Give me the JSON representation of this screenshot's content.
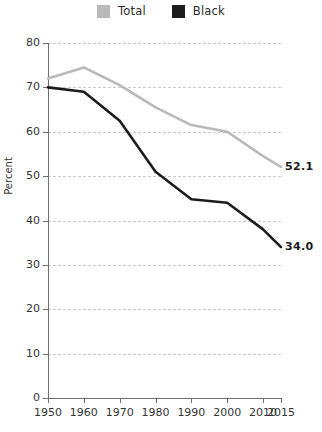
{
  "chart_data": {
    "type": "line",
    "title": "",
    "xlabel": "",
    "ylabel": "Percent",
    "grid": true,
    "legend_position": "top-center",
    "x": [
      1950,
      1960,
      1970,
      1980,
      1990,
      2000,
      2010,
      2015
    ],
    "xlim": [
      1950,
      2015
    ],
    "ylim": [
      0,
      80
    ],
    "xtick_labels": [
      "1950",
      "1960",
      "1970",
      "1980",
      "1990",
      "2000",
      "2010",
      "2015"
    ],
    "ytick_labels": [
      "0",
      "10",
      "20",
      "30",
      "40",
      "50",
      "60",
      "70",
      "80"
    ],
    "ytick_values": [
      0,
      10,
      20,
      30,
      40,
      50,
      60,
      70,
      80
    ],
    "series": [
      {
        "name": "Total",
        "color": "#b9b9b9",
        "values": [
          72.0,
          74.5,
          70.5,
          65.5,
          61.5,
          60.0,
          54.5,
          52.1
        ],
        "end_label": "52.1"
      },
      {
        "name": "Black",
        "color": "#1c1c1c",
        "values": [
          70.0,
          69.0,
          62.5,
          51.0,
          44.8,
          44.0,
          38.0,
          34.0
        ],
        "end_label": "34.0"
      }
    ]
  },
  "legend": {
    "items": [
      {
        "label": "Total",
        "color": "#b9b9b9"
      },
      {
        "label": "Black",
        "color": "#1c1c1c"
      }
    ]
  },
  "colors": {
    "total": "#b9b9b9",
    "black": "#1c1c1c",
    "axis": "#6e6e6e",
    "grid": "#c9c9c9",
    "text": "#333333",
    "background": "#ffffff"
  }
}
